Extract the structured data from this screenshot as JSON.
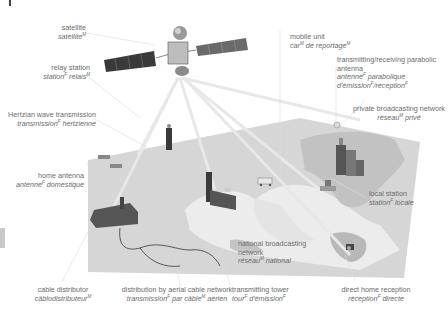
{
  "diagram": {
    "colors": {
      "background": "#ffffff",
      "map_panel": "#d4d4d4",
      "land_light": "#ececec",
      "land_dark": "#bdbdbd",
      "beam": "#e6e6e6",
      "label_text": "#6b6b6b"
    },
    "labels": {
      "satellite": {
        "en": "satellite",
        "fr": "satellite",
        "fr_gender": "M"
      },
      "relay_station": {
        "en": "relay station",
        "fr_a": "station",
        "fr_a_gender": "F",
        "fr_b": "relais",
        "fr_b_gender": "M"
      },
      "hertzian": {
        "en": "Hertzian wave transmission",
        "fr_a": "transmission",
        "fr_a_gender": "F",
        "fr_b": "hertzienne"
      },
      "home_antenna": {
        "en": "home antenna",
        "fr_a": "antenne",
        "fr_a_gender": "F",
        "fr_b": "domestique"
      },
      "cable_distributor": {
        "en": "cable distributor",
        "fr": "câblodistributeur",
        "fr_gender": "M"
      },
      "aerial_cable": {
        "en": "distribution by aerial cable network",
        "fr_a": "transmission",
        "fr_a_gender": "F",
        "fr_b": "par câble",
        "fr_b_gender": "M",
        "fr_c": "aérien"
      },
      "transmitting_tower": {
        "en": "transmitting tower",
        "fr_a": "tour",
        "fr_a_gender": "F",
        "fr_b": "d'émission",
        "fr_b_gender": "F"
      },
      "national_network": {
        "en_1": "national broadcasting",
        "en_2": "network",
        "fr_a": "réseau",
        "fr_a_gender": "M",
        "fr_b": "national"
      },
      "direct_home": {
        "en": "direct home reception",
        "fr_a": "réception",
        "fr_a_gender": "F",
        "fr_b": "directe"
      },
      "local_station": {
        "en": "local station",
        "fr_a": "station",
        "fr_a_gender": "F",
        "fr_b": "locale"
      },
      "private_network": {
        "en": "private broadcasting network",
        "fr_a": "réseau",
        "fr_a_gender": "M",
        "fr_b": "privé"
      },
      "parabolic_antenna": {
        "en_1": "transmitting/receiving parabolic",
        "en_2": "antenna",
        "fr_1a": "antenne",
        "fr_1a_gender": "F",
        "fr_1b": "parabolique",
        "fr_2a": "d'émission",
        "fr_2a_gender": "F",
        "fr_2b": "/réception",
        "fr_2b_gender": "F"
      },
      "mobile_unit": {
        "en": "mobile unit",
        "fr_a": "car",
        "fr_a_gender": "M",
        "fr_b": "de reportage",
        "fr_b_gender": "M"
      }
    }
  }
}
